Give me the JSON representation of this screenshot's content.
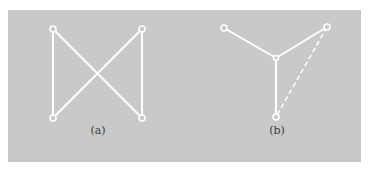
{
  "figure": {
    "background": "#c9c9c9",
    "line_color": "#ffffff",
    "subfigures": [
      {
        "id": "a",
        "label": "(a)",
        "nodes": [
          {
            "id": "a-tl",
            "x": 53,
            "y": 29
          },
          {
            "id": "a-tr",
            "x": 142,
            "y": 29
          },
          {
            "id": "a-bl",
            "x": 53,
            "y": 118
          },
          {
            "id": "a-br",
            "x": 142,
            "y": 118
          }
        ],
        "edges": [
          {
            "from": "a-tl",
            "to": "a-bl",
            "style": "solid"
          },
          {
            "from": "a-tr",
            "to": "a-br",
            "style": "solid"
          },
          {
            "from": "a-tl",
            "to": "a-br",
            "style": "solid"
          },
          {
            "from": "a-tr",
            "to": "a-bl",
            "style": "solid"
          }
        ]
      },
      {
        "id": "b",
        "label": "(b)",
        "nodes": [
          {
            "id": "b-tl",
            "x": 224,
            "y": 28
          },
          {
            "id": "b-tr",
            "x": 327,
            "y": 27
          },
          {
            "id": "b-c",
            "x": 276,
            "y": 58
          },
          {
            "id": "b-b",
            "x": 276,
            "y": 117
          }
        ],
        "edges": [
          {
            "from": "b-tl",
            "to": "b-c",
            "style": "solid"
          },
          {
            "from": "b-tr",
            "to": "b-c",
            "style": "solid"
          },
          {
            "from": "b-c",
            "to": "b-b",
            "style": "solid"
          },
          {
            "from": "b-tr",
            "to": "b-b",
            "style": "dashed"
          }
        ]
      }
    ]
  }
}
